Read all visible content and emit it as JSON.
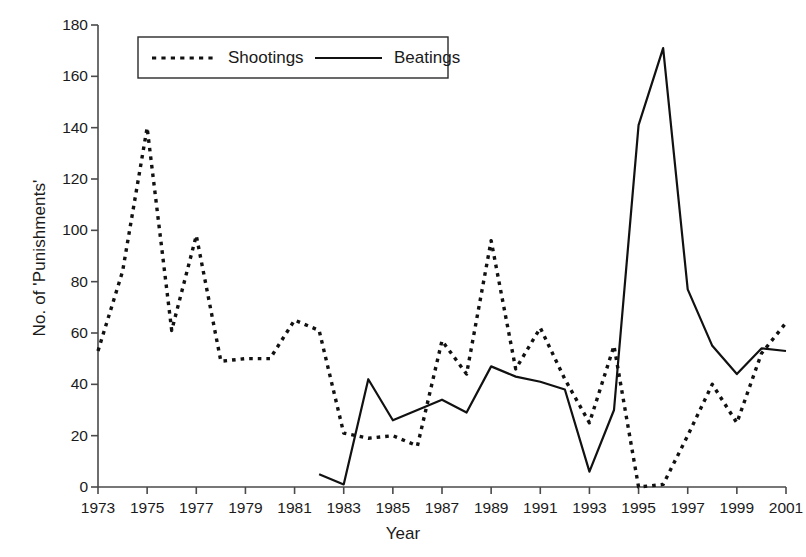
{
  "chart_data": {
    "type": "line",
    "title": "",
    "xlabel": "Year",
    "ylabel": "No. of 'Punishments'",
    "xlim": [
      1973,
      2001
    ],
    "ylim": [
      0,
      180
    ],
    "xticks": [
      1973,
      1975,
      1977,
      1979,
      1981,
      1983,
      1985,
      1987,
      1989,
      1991,
      1993,
      1995,
      1997,
      1999,
      2001
    ],
    "yticks": [
      0,
      20,
      40,
      60,
      80,
      100,
      120,
      140,
      160,
      180
    ],
    "xtick_labels": [
      "1973",
      "1975",
      "1977",
      "1979",
      "1981",
      "1983",
      "1985",
      "1987",
      "1989",
      "1991",
      "1993",
      "1995",
      "1997",
      "1999",
      "2001"
    ],
    "ytick_labels": [
      "0",
      "20",
      "40",
      "60",
      "80",
      "100",
      "120",
      "140",
      "160",
      "180"
    ],
    "grid": false,
    "legend_position": "top-center",
    "series": [
      {
        "name": "Shootings",
        "style": "dotted",
        "color": "#111111",
        "x": [
          1973,
          1974,
          1975,
          1976,
          1977,
          1978,
          1979,
          1980,
          1981,
          1982,
          1983,
          1984,
          1985,
          1986,
          1987,
          1988,
          1989,
          1990,
          1991,
          1992,
          1993,
          1994,
          1995,
          1996,
          1997,
          1998,
          1999,
          2000,
          2001
        ],
        "values": [
          53,
          84,
          140,
          61,
          98,
          49,
          50,
          50,
          65,
          61,
          21,
          19,
          20,
          16,
          57,
          44,
          96,
          46,
          62,
          42,
          25,
          55,
          0,
          1,
          20,
          40,
          25,
          52,
          64
        ]
      },
      {
        "name": "Beatings",
        "style": "solid",
        "color": "#111111",
        "x": [
          1982,
          1983,
          1984,
          1985,
          1986,
          1987,
          1988,
          1989,
          1990,
          1991,
          1992,
          1993,
          1994,
          1995,
          1996,
          1997,
          1998,
          1999,
          2000,
          2001
        ],
        "values": [
          5,
          1,
          42,
          26,
          30,
          34,
          29,
          47,
          43,
          41,
          38,
          6,
          30,
          141,
          171,
          77,
          55,
          44,
          54,
          53
        ]
      }
    ]
  },
  "legend": {
    "entries": [
      {
        "label": "Shootings",
        "style": "dotted"
      },
      {
        "label": "Beatings",
        "style": "solid"
      }
    ]
  },
  "axes": {
    "y_title": "No. of 'Punishments'",
    "x_title": "Year"
  }
}
